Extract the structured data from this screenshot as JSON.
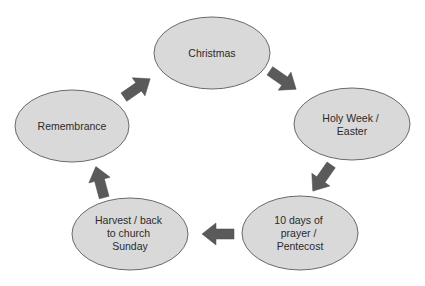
{
  "diagram": {
    "type": "cycle",
    "nodes": [
      {
        "id": "christmas",
        "lines": [
          "Christmas"
        ]
      },
      {
        "id": "holy-week-easter",
        "lines": [
          "Holy Week /",
          "Easter"
        ]
      },
      {
        "id": "ten-days-pentecost",
        "lines": [
          "10 days of",
          "prayer /",
          "Pentecost"
        ]
      },
      {
        "id": "harvest-back-to-church",
        "lines": [
          "Harvest / back",
          "to church",
          "Sunday"
        ]
      },
      {
        "id": "remembrance",
        "lines": [
          "Remembrance"
        ]
      }
    ],
    "edges": [
      {
        "from": "christmas",
        "to": "holy-week-easter"
      },
      {
        "from": "holy-week-easter",
        "to": "ten-days-pentecost"
      },
      {
        "from": "ten-days-pentecost",
        "to": "harvest-back-to-church"
      },
      {
        "from": "harvest-back-to-church",
        "to": "remembrance"
      },
      {
        "from": "remembrance",
        "to": "christmas"
      }
    ],
    "colors": {
      "node_fill": "#d9d9d9",
      "node_stroke": "#6a6a6a",
      "arrow": "#5a5a5a"
    }
  }
}
